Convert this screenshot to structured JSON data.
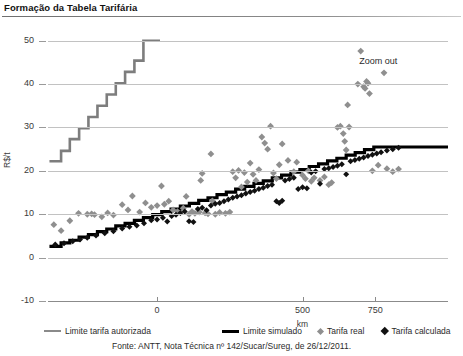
{
  "header": {
    "title": "Formação da Tabela Tarifária"
  },
  "chart_annotations": {
    "zoom_out_label": "Zoom out"
  },
  "legend": {
    "items": [
      {
        "label": "Limite tarifa autorizada",
        "marker": "line",
        "color": "#8a8a8a"
      },
      {
        "label": "Limite simulado",
        "marker": "line-bold",
        "color": "#000000"
      },
      {
        "label": "Tarifa real",
        "marker": "diamond",
        "color": "#8f8f8f"
      },
      {
        "label": "Tarifa calculada",
        "marker": "diamond",
        "color": "#111111"
      }
    ]
  },
  "footer": {
    "source": "Fonte: ANTT, Nota Técnica nº 142/Sucar/Sureg, de 26/12/2011."
  },
  "chart_data": {
    "type": "scatter",
    "title": "Formação da Tabela Tarifária",
    "xlabel": "km",
    "ylabel": "R$/t",
    "xlim": [
      -375,
      1000
    ],
    "ylim": [
      -10,
      52
    ],
    "xticks": [
      0,
      500,
      750
    ],
    "xtick_labels": [
      "0",
      "500",
      "750"
    ],
    "yticks": [
      -10,
      0,
      10,
      20,
      30,
      40,
      50
    ],
    "ytick_labels": [
      "-10",
      "0",
      "10",
      "20",
      "30",
      "40",
      "50"
    ],
    "grid": true,
    "legend_position": "bottom",
    "series": [
      {
        "name": "Limite tarifa autorizada",
        "type": "step",
        "color": "#7d7d7d",
        "width": 2.6,
        "points": [
          [
            -370,
            22.2
          ],
          [
            -330,
            22.2
          ],
          [
            -330,
            24.6
          ],
          [
            -300,
            24.6
          ],
          [
            -300,
            27.3
          ],
          [
            -268,
            27.3
          ],
          [
            -268,
            29.8
          ],
          [
            -236,
            29.8
          ],
          [
            -236,
            32.4
          ],
          [
            -205,
            32.4
          ],
          [
            -205,
            35.0
          ],
          [
            -173,
            35.0
          ],
          [
            -173,
            37.6
          ],
          [
            -142,
            37.6
          ],
          [
            -142,
            40.2
          ],
          [
            -110,
            40.2
          ],
          [
            -110,
            42.8
          ],
          [
            -78,
            42.8
          ],
          [
            -78,
            45.4
          ],
          [
            -47,
            45.4
          ],
          [
            -47,
            50.0
          ],
          [
            10,
            50.0
          ]
        ]
      },
      {
        "name": "Limite simulado",
        "type": "step",
        "color": "#000000",
        "width": 3.2,
        "points": [
          [
            -370,
            2.6
          ],
          [
            -330,
            2.6
          ],
          [
            -330,
            3.4
          ],
          [
            -300,
            3.4
          ],
          [
            -300,
            4.0
          ],
          [
            -268,
            4.0
          ],
          [
            -268,
            4.7
          ],
          [
            -236,
            4.7
          ],
          [
            -236,
            5.3
          ],
          [
            -205,
            5.3
          ],
          [
            -205,
            6.0
          ],
          [
            -173,
            6.0
          ],
          [
            -173,
            6.6
          ],
          [
            -142,
            6.6
          ],
          [
            -142,
            7.3
          ],
          [
            -110,
            7.3
          ],
          [
            -110,
            7.9
          ],
          [
            -78,
            7.9
          ],
          [
            -78,
            8.6
          ],
          [
            -47,
            8.6
          ],
          [
            -47,
            9.2
          ],
          [
            -15,
            9.2
          ],
          [
            -15,
            9.9
          ],
          [
            16,
            9.9
          ],
          [
            16,
            10.6
          ],
          [
            48,
            10.6
          ],
          [
            48,
            11.2
          ],
          [
            80,
            11.2
          ],
          [
            80,
            11.9
          ],
          [
            111,
            11.9
          ],
          [
            111,
            12.5
          ],
          [
            143,
            12.5
          ],
          [
            143,
            13.2
          ],
          [
            175,
            13.2
          ],
          [
            175,
            13.8
          ],
          [
            206,
            13.8
          ],
          [
            206,
            14.5
          ],
          [
            238,
            14.5
          ],
          [
            238,
            15.1
          ],
          [
            270,
            15.1
          ],
          [
            270,
            15.8
          ],
          [
            301,
            15.8
          ],
          [
            301,
            16.4
          ],
          [
            333,
            16.4
          ],
          [
            333,
            17.1
          ],
          [
            365,
            17.1
          ],
          [
            365,
            17.7
          ],
          [
            396,
            17.7
          ],
          [
            396,
            18.4
          ],
          [
            428,
            18.4
          ],
          [
            428,
            19.0
          ],
          [
            460,
            19.0
          ],
          [
            460,
            19.7
          ],
          [
            491,
            19.7
          ],
          [
            491,
            20.3
          ],
          [
            523,
            20.3
          ],
          [
            523,
            21.0
          ],
          [
            555,
            21.0
          ],
          [
            555,
            21.6
          ],
          [
            586,
            21.6
          ],
          [
            586,
            22.3
          ],
          [
            618,
            22.3
          ],
          [
            618,
            22.9
          ],
          [
            650,
            22.9
          ],
          [
            650,
            23.6
          ],
          [
            681,
            23.6
          ],
          [
            681,
            24.2
          ],
          [
            713,
            24.2
          ],
          [
            713,
            24.9
          ],
          [
            745,
            24.9
          ],
          [
            745,
            25.5
          ],
          [
            1000,
            25.5
          ]
        ]
      },
      {
        "name": "Tarifa real",
        "type": "scatter",
        "color": "#8f8f8f",
        "marker": "diamond",
        "size": 3.4,
        "points": [
          [
            -355,
            7.6
          ],
          [
            -330,
            6.2
          ],
          [
            -300,
            8.5
          ],
          [
            -270,
            10.2
          ],
          [
            -240,
            10.0
          ],
          [
            -225,
            10.1
          ],
          [
            -215,
            9.9
          ],
          [
            -190,
            9.4
          ],
          [
            -170,
            10.3
          ],
          [
            -150,
            9.8
          ],
          [
            -120,
            12.2
          ],
          [
            -100,
            11.0
          ],
          [
            -85,
            14.2
          ],
          [
            -60,
            10.5
          ],
          [
            -40,
            12.6
          ],
          [
            -20,
            11.6
          ],
          [
            0,
            12.0
          ],
          [
            15,
            16.5
          ],
          [
            25,
            12.3
          ],
          [
            40,
            13.0
          ],
          [
            55,
            11.0
          ],
          [
            70,
            10.6
          ],
          [
            90,
            11.4
          ],
          [
            100,
            14.1
          ],
          [
            110,
            10.0
          ],
          [
            120,
            10.6
          ],
          [
            130,
            10.2
          ],
          [
            145,
            10.5
          ],
          [
            150,
            17.8
          ],
          [
            155,
            19.4
          ],
          [
            165,
            10.3
          ],
          [
            175,
            10.1
          ],
          [
            185,
            23.9
          ],
          [
            190,
            13.1
          ],
          [
            200,
            10.0
          ],
          [
            215,
            10.4
          ],
          [
            235,
            10.2
          ],
          [
            250,
            10.5
          ],
          [
            260,
            19.8
          ],
          [
            270,
            18.4
          ],
          [
            280,
            20.1
          ],
          [
            290,
            16.3
          ],
          [
            300,
            19.6
          ],
          [
            310,
            17.4
          ],
          [
            320,
            21.8
          ],
          [
            330,
            19.2
          ],
          [
            340,
            17.8
          ],
          [
            350,
            20.3
          ],
          [
            360,
            27.8
          ],
          [
            370,
            26.4
          ],
          [
            380,
            25.0
          ],
          [
            390,
            30.3
          ],
          [
            400,
            19.5
          ],
          [
            410,
            18.2
          ],
          [
            420,
            21.4
          ],
          [
            430,
            26.2
          ],
          [
            450,
            22.4
          ],
          [
            470,
            19.8
          ],
          [
            480,
            22.0
          ],
          [
            500,
            19.0
          ],
          [
            510,
            18.2
          ],
          [
            520,
            20.0
          ],
          [
            530,
            17.6
          ],
          [
            540,
            18.4
          ],
          [
            560,
            17.8
          ],
          [
            575,
            18.6
          ],
          [
            590,
            16.8
          ],
          [
            600,
            17.3
          ],
          [
            620,
            30.0
          ],
          [
            630,
            30.3
          ],
          [
            640,
            28.6
          ],
          [
            645,
            26.8
          ],
          [
            650,
            24.8
          ],
          [
            655,
            35.2
          ],
          [
            660,
            30.1
          ],
          [
            690,
            40.0
          ],
          [
            700,
            47.6
          ],
          [
            710,
            39.4
          ],
          [
            715,
            39.0
          ],
          [
            720,
            40.6
          ],
          [
            725,
            40.2
          ],
          [
            730,
            37.8
          ],
          [
            740,
            20.0
          ],
          [
            760,
            21.3
          ],
          [
            780,
            42.6
          ],
          [
            790,
            20.5
          ],
          [
            810,
            19.8
          ],
          [
            830,
            20.4
          ]
        ]
      },
      {
        "name": "Tarifa calculada",
        "type": "scatter",
        "color": "#111111",
        "marker": "diamond",
        "size": 3.0,
        "points": [
          [
            -350,
            3.0
          ],
          [
            -320,
            3.3
          ],
          [
            -290,
            3.8
          ],
          [
            -265,
            4.2
          ],
          [
            -240,
            4.6
          ],
          [
            -210,
            5.1
          ],
          [
            -180,
            5.6
          ],
          [
            -150,
            6.1
          ],
          [
            -120,
            6.7
          ],
          [
            -95,
            7.1
          ],
          [
            -70,
            7.4
          ],
          [
            -45,
            7.9
          ],
          [
            -20,
            8.6
          ],
          [
            0,
            8.8
          ],
          [
            20,
            9.2
          ],
          [
            35,
            8.3
          ],
          [
            50,
            9.6
          ],
          [
            65,
            9.9
          ],
          [
            80,
            10.3
          ],
          [
            95,
            10.6
          ],
          [
            110,
            8.4
          ],
          [
            125,
            8.2
          ],
          [
            140,
            11.2
          ],
          [
            155,
            11.5
          ],
          [
            170,
            10.9
          ],
          [
            185,
            12.0
          ],
          [
            200,
            12.4
          ],
          [
            215,
            12.6
          ],
          [
            230,
            13.0
          ],
          [
            245,
            13.4
          ],
          [
            260,
            13.8
          ],
          [
            275,
            14.1
          ],
          [
            290,
            14.4
          ],
          [
            305,
            14.8
          ],
          [
            320,
            15.1
          ],
          [
            335,
            15.4
          ],
          [
            350,
            15.8
          ],
          [
            365,
            16.1
          ],
          [
            380,
            16.5
          ],
          [
            395,
            16.8
          ],
          [
            410,
            13.0
          ],
          [
            420,
            12.6
          ],
          [
            430,
            13.1
          ],
          [
            440,
            17.8
          ],
          [
            455,
            18.1
          ],
          [
            470,
            18.4
          ],
          [
            485,
            15.8
          ],
          [
            500,
            16.2
          ],
          [
            515,
            16.0
          ],
          [
            530,
            19.6
          ],
          [
            545,
            19.9
          ],
          [
            560,
            17.0
          ],
          [
            575,
            20.4
          ],
          [
            590,
            20.6
          ],
          [
            605,
            20.9
          ],
          [
            620,
            21.2
          ],
          [
            635,
            21.5
          ],
          [
            650,
            19.2
          ],
          [
            665,
            22.2
          ],
          [
            680,
            22.5
          ],
          [
            695,
            22.8
          ],
          [
            710,
            23.1
          ],
          [
            725,
            23.4
          ],
          [
            740,
            23.7
          ],
          [
            755,
            24.0
          ],
          [
            770,
            24.3
          ],
          [
            790,
            24.7
          ],
          [
            810,
            25.0
          ],
          [
            830,
            25.3
          ]
        ]
      }
    ]
  }
}
